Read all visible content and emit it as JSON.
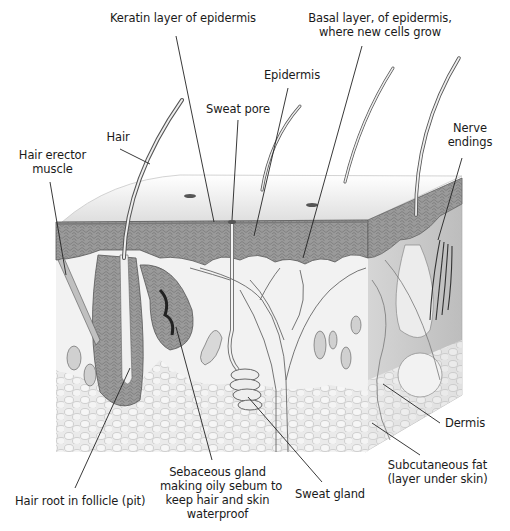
{
  "diagram": {
    "colors": {
      "background": "#ffffff",
      "epidermis": "#8f8f8f",
      "dermis": "#efefef",
      "fat": "#e2e2e2",
      "line": "#222222",
      "label_text": "#1a1a1a"
    },
    "labels": [
      {
        "id": "keratin",
        "text": "Keratin layer of epidermis",
        "x": 108,
        "y": 11,
        "w": 150,
        "align": "center",
        "leader": {
          "x1": 176,
          "y1": 36,
          "x2": 214,
          "y2": 222
        }
      },
      {
        "id": "basal",
        "text": "Basal layer, of epidermis,\nwhere new cells grow",
        "x": 300,
        "y": 11,
        "w": 160,
        "align": "center",
        "leader": {
          "x1": 362,
          "y1": 46,
          "x2": 303,
          "y2": 258
        }
      },
      {
        "id": "epidermis",
        "text": "Epidermis",
        "x": 262,
        "y": 68,
        "w": 60,
        "align": "center",
        "leader": {
          "x1": 288,
          "y1": 88,
          "x2": 254,
          "y2": 236
        }
      },
      {
        "id": "sweat-pore",
        "text": "Sweat pore",
        "x": 203,
        "y": 102,
        "w": 70,
        "align": "center",
        "leader": {
          "x1": 238,
          "y1": 120,
          "x2": 232,
          "y2": 220
        }
      },
      {
        "id": "hair",
        "text": "Hair",
        "x": 103,
        "y": 130,
        "w": 30,
        "align": "center",
        "leader": {
          "x1": 120,
          "y1": 149,
          "x2": 150,
          "y2": 164
        }
      },
      {
        "id": "nerve-endings",
        "text": "Nerve\nendings",
        "x": 445,
        "y": 121,
        "w": 50,
        "align": "center",
        "leader": {
          "x1": 462,
          "y1": 158,
          "x2": 438,
          "y2": 240
        }
      },
      {
        "id": "hair-erector",
        "text": "Hair erector\nmuscle",
        "x": 15,
        "y": 148,
        "w": 75,
        "align": "center",
        "leader": {
          "x1": 50,
          "y1": 182,
          "x2": 66,
          "y2": 275
        }
      },
      {
        "id": "dermis",
        "text": "Dermis",
        "x": 440,
        "y": 416,
        "w": 50,
        "align": "center",
        "leader": {
          "x1": 440,
          "y1": 423,
          "x2": 383,
          "y2": 384
        }
      },
      {
        "id": "subcutaneous",
        "text": "Subcutaneous fat\n(layer under skin)",
        "x": 385,
        "y": 458,
        "w": 105,
        "align": "center",
        "leader": {
          "x1": 420,
          "y1": 455,
          "x2": 372,
          "y2": 423
        }
      },
      {
        "id": "sebaceous",
        "text": "Sebaceous gland\nmaking oily sebum to\nkeep hair and skin\nwaterproof",
        "x": 160,
        "y": 465,
        "w": 115,
        "align": "center",
        "leader": {
          "x1": 212,
          "y1": 460,
          "x2": 176,
          "y2": 327
        }
      },
      {
        "id": "sweat-gland",
        "text": "Sweat gland",
        "x": 295,
        "y": 487,
        "w": 70,
        "align": "center",
        "leader": {
          "x1": 322,
          "y1": 482,
          "x2": 248,
          "y2": 397
        }
      },
      {
        "id": "hair-root",
        "text": "Hair root in follicle (pit)",
        "x": 15,
        "y": 494,
        "w": 130,
        "align": "center",
        "leader": {
          "x1": 75,
          "y1": 488,
          "x2": 130,
          "y2": 368
        }
      }
    ]
  }
}
